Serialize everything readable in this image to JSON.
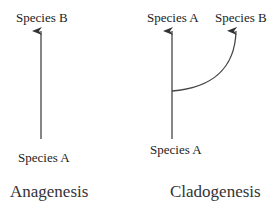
{
  "anagenesis": {
    "top_label": "Species B",
    "bottom_label": "Species A",
    "caption": "Anagenesis"
  },
  "cladogenesis": {
    "top_left_label": "Species A",
    "top_right_label": "Species B",
    "bottom_label": "Species A",
    "caption": "Cladogenesis"
  },
  "colors": {
    "line": "#333333",
    "text": "#222222"
  }
}
